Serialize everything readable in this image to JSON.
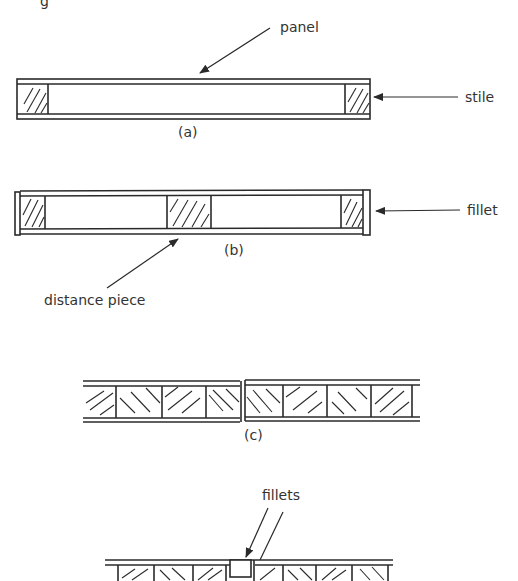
{
  "figure": {
    "partial_header": "g",
    "diagram_a": {
      "caption": "(a)",
      "labels": {
        "panel": "panel",
        "stile": "stile"
      }
    },
    "diagram_b": {
      "caption": "(b)",
      "labels": {
        "fillet": "fillet",
        "distance_piece": "distance piece"
      }
    },
    "diagram_c": {
      "caption": "(c)"
    },
    "diagram_d": {
      "labels": {
        "fillets": "fillets"
      }
    },
    "colors": {
      "ink": "#2a2a2a",
      "text": "#333333",
      "background": "#ffffff"
    }
  }
}
